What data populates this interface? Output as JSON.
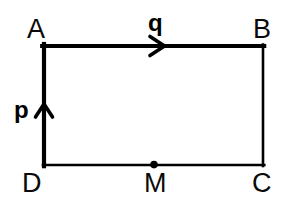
{
  "figure": {
    "background_color": "#ffffff",
    "stroke_color": "#000000",
    "width": 296,
    "height": 201
  },
  "vertices": [
    {
      "id": "A",
      "label": "A",
      "x": 44,
      "y": 46,
      "corner": "top-left"
    },
    {
      "id": "B",
      "label": "B",
      "x": 263,
      "y": 46,
      "corner": "top-right"
    },
    {
      "id": "C",
      "label": "C",
      "x": 263,
      "y": 165,
      "corner": "bottom-right"
    },
    {
      "id": "D",
      "label": "D",
      "x": 44,
      "y": 165,
      "corner": "bottom-left"
    }
  ],
  "points": [
    {
      "id": "M",
      "label": "M",
      "x": 154,
      "y": 165,
      "marker": "filled-dot",
      "radius": 3.6,
      "note": "midpoint of DC"
    }
  ],
  "edges": [
    {
      "id": "AB",
      "from": "A",
      "to": "B",
      "stroke_width": 4.2,
      "emphasis": "thick"
    },
    {
      "id": "BC",
      "from": "B",
      "to": "C",
      "stroke_width": 2.6,
      "emphasis": "thin"
    },
    {
      "id": "DC",
      "from": "D",
      "to": "C",
      "stroke_width": 2.6,
      "emphasis": "thin"
    },
    {
      "id": "DA",
      "from": "D",
      "to": "A",
      "stroke_width": 4.2,
      "emphasis": "thick"
    }
  ],
  "vectors": [
    {
      "id": "q",
      "label": "q",
      "on_edge": "AB",
      "direction": "right",
      "arrow_tip_x": 164,
      "arrow_tip_y": 46,
      "label_x": 148,
      "label_y": 11
    },
    {
      "id": "p",
      "label": "p",
      "on_edge": "DA",
      "direction": "up",
      "arrow_tip_x": 44,
      "arrow_tip_y": 104,
      "label_x": 14,
      "label_y": 98
    }
  ],
  "labels": {
    "A": "A",
    "B": "B",
    "C": "C",
    "D": "D",
    "M": "M",
    "p": "p",
    "q": "q"
  }
}
